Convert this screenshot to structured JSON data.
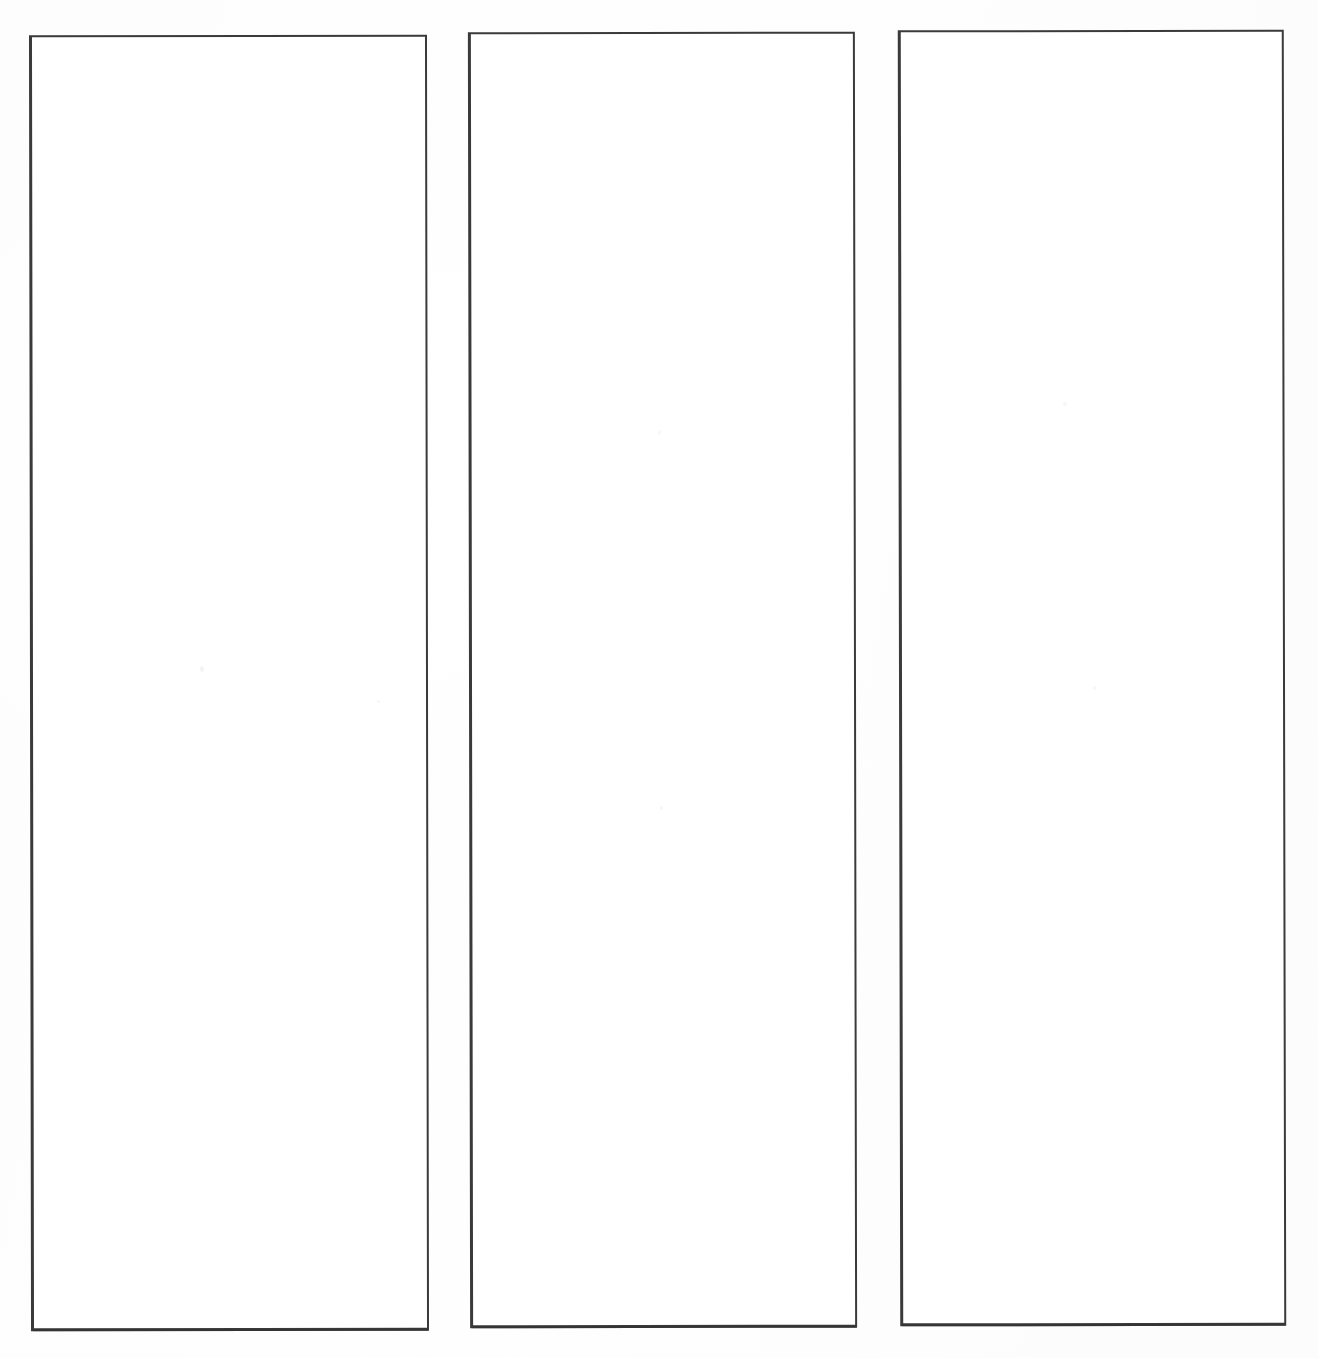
{
  "page": {
    "title": "Blank Three-Column Template",
    "background_color": "#fdfdfd",
    "width": 1318,
    "height": 1358
  },
  "style": {
    "border_color": "#3a3a3a",
    "box_fill_color": "#ffffff",
    "border_width_px": 2
  },
  "columns": [
    {
      "id": "column-1",
      "label": "",
      "content": "",
      "x": 30,
      "y": 35,
      "width": 398,
      "height": 1296
    },
    {
      "id": "column-2",
      "label": "",
      "content": "",
      "x": 469,
      "y": 32,
      "width": 387,
      "height": 1296
    },
    {
      "id": "column-3",
      "label": "",
      "content": "",
      "x": 899,
      "y": 30,
      "width": 386,
      "height": 1296
    }
  ]
}
